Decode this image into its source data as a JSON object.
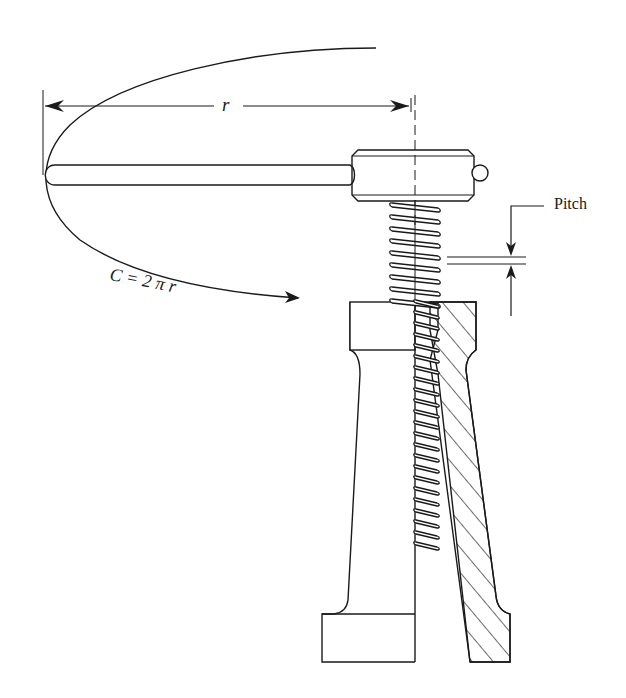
{
  "diagram": {
    "labels": {
      "radius": "r",
      "circumference": "C = 2 π r",
      "pitch": "Pitch"
    },
    "colors": {
      "line": "#1a1a1a",
      "background": "#ffffff"
    }
  }
}
